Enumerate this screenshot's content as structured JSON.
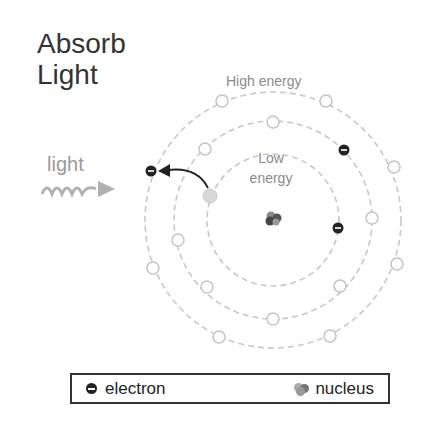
{
  "title": {
    "line1": "Absorb",
    "line2": "Light"
  },
  "labels": {
    "high_energy": "High energy",
    "low_energy_1": "Low",
    "low_energy_2": "energy",
    "light": "light"
  },
  "legend": {
    "electron_label": "electron",
    "nucleus_label": "nucleus"
  },
  "diagram": {
    "center": [
      273,
      220
    ],
    "orbits": [
      {
        "name": "inner",
        "radius": 66
      },
      {
        "name": "middle",
        "radius": 99
      },
      {
        "name": "outer",
        "radius": 128
      }
    ],
    "electrons": [
      {
        "orbit": "outer",
        "position": [
          150,
          171
        ],
        "state": "excited"
      },
      {
        "orbit": "middle",
        "position": [
          344,
          150
        ]
      },
      {
        "orbit": "inner",
        "position": [
          338,
          228
        ]
      }
    ],
    "vacated_position": [
      210,
      196
    ],
    "colors": {
      "orbit": "#c8c8c8",
      "electron": "#222222",
      "vacated": "#d6d6d6",
      "light_wave": "#b0b0b0",
      "text_gray": "#8a8a8a"
    }
  }
}
